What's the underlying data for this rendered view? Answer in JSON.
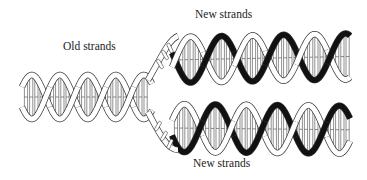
{
  "figure": {
    "labels": {
      "old_strands": "Old strands",
      "new_strands_top": "New strands",
      "new_strands_bottom": "New strands"
    },
    "colors": {
      "old_strand_fill": "#ffffff",
      "old_strand_outline": "#333333",
      "new_strand_fill": "#111111",
      "background": "#ffffff"
    },
    "parts": [
      {
        "name": "parental-helix",
        "strand_type": "old"
      },
      {
        "name": "daughter-helix-top",
        "strand_types": [
          "old",
          "new"
        ]
      },
      {
        "name": "daughter-helix-bottom",
        "strand_types": [
          "old",
          "new"
        ]
      }
    ]
  }
}
